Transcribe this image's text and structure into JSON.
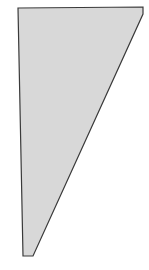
{
  "diagram": {
    "shape": "quadrilateral",
    "points": "18,8 143,7 143,14 33,256 23,256",
    "fill": "#d8d8d8",
    "stroke": "#3a3a3a",
    "stroke_width": 1.2
  }
}
